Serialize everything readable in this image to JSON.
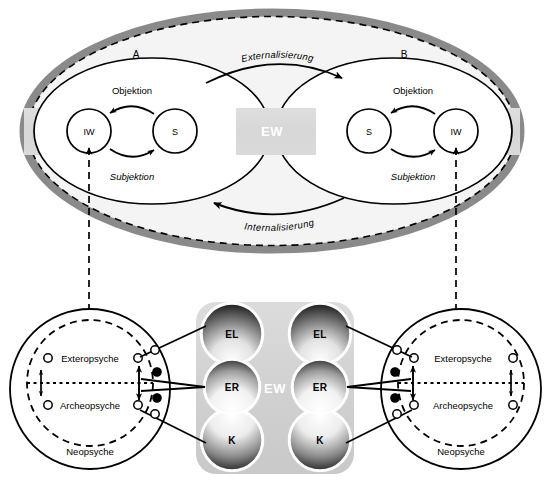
{
  "figure": {
    "colors": {
      "outer_ellipse_border": "#8a8a8a",
      "ellipse_fill": "#f3f3f3",
      "ew_band": "#d9d9d9",
      "ew_panel": "#d6d6d6",
      "ink": "#000000",
      "lobe_dark": "#2b2b2b",
      "lobe_light": "#ffffff"
    }
  },
  "upper": {
    "side_a_label": "A",
    "side_b_label": "B",
    "ew_label": "EW",
    "flow_top_label": "Externalisierung",
    "flow_bottom_label": "Internalisierung",
    "a": {
      "iw_label": "IW",
      "s_label": "S",
      "top_arrow_label": "Objektion",
      "bottom_arrow_label": "Subjektion"
    },
    "b": {
      "iw_label": "IW",
      "s_label": "S",
      "top_arrow_label": "Objektion",
      "bottom_arrow_label": "Subjektion"
    }
  },
  "lower": {
    "ew_label": "EW",
    "left": {
      "exteropsyche_label": "Exteropsyche",
      "archeopsyche_label": "Archeopsyche",
      "neopsyche_label": "Neopsyche"
    },
    "right": {
      "exteropsyche_label": "Exteropsyche",
      "archeopsyche_label": "Archeopsyche",
      "neopsyche_label": "Neopsyche"
    },
    "lobes_left": {
      "top_label": "EL",
      "middle_label": "ER",
      "bottom_label": "K"
    },
    "lobes_right": {
      "top_label": "EL",
      "middle_label": "ER",
      "bottom_label": "K"
    }
  }
}
